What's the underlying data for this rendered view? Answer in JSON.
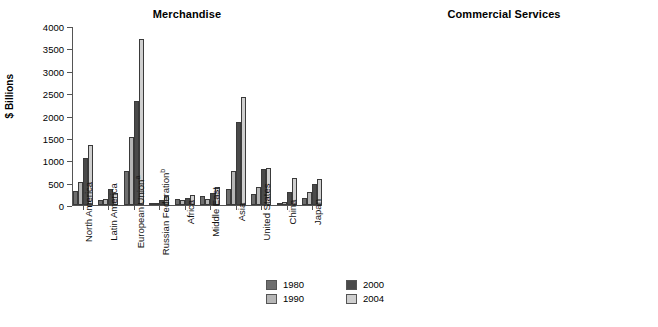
{
  "figure": {
    "legend": {
      "entries": [
        {
          "label": "1980",
          "color": "#6e6e6e",
          "key": "s1980"
        },
        {
          "label": "1990",
          "color": "#b6b6b6",
          "key": "s1990"
        },
        {
          "label": "2000",
          "color": "#4a4a4a",
          "key": "s2000"
        },
        {
          "label": "2004",
          "color": "#cfcfcf",
          "key": "s2004"
        }
      ]
    }
  },
  "chart_data": [
    {
      "type": "bar",
      "title": "Merchandise",
      "xlabel": "",
      "ylabel": "$ Billions",
      "ylim": [
        0,
        4000
      ],
      "yticks": [
        0,
        500,
        1000,
        1500,
        2000,
        2500,
        3000,
        3500,
        4000
      ],
      "grid": false,
      "legend_position": "bottom-center",
      "categories": [
        "North America",
        "Latin America",
        "European Union",
        "Russian Federation",
        "Africa",
        "Middle East",
        "Asia",
        "United States",
        "China",
        "Japan"
      ],
      "category_footnotes": [
        "",
        "",
        "a",
        "b",
        "",
        "",
        "",
        "",
        "",
        ""
      ],
      "series": [
        {
          "name": "1980",
          "values": [
            309,
            107,
            767,
            0,
            125,
            211,
            350,
            246,
            52,
            158
          ]
        },
        {
          "name": "1990",
          "values": [
            521,
            134,
            1524,
            0,
            105,
            138,
            751,
            410,
            75,
            280
          ]
        },
        {
          "name": "2000",
          "values": [
            1059,
            360,
            2334,
            105,
            148,
            268,
            1855,
            802,
            280,
            479
          ]
        },
        {
          "name": "2004",
          "values": [
            1330,
            276,
            3714,
            198,
            232,
            398,
            2410,
            824,
            612,
            581
          ]
        }
      ]
    },
    {
      "type": "bar",
      "title": "Commercial Services",
      "xlabel": "",
      "ylabel": "$ Billions",
      "ylim": [
        0,
        1200
      ],
      "yticks": [
        0,
        200,
        400,
        600,
        800,
        1000,
        1200
      ],
      "grid": false,
      "legend_position": "bottom-center",
      "categories": [
        "North America",
        "Latin America",
        "European Union",
        "Russian Federation",
        "Africa",
        "Middle East",
        "Asia",
        "United States",
        "China",
        "Japan"
      ],
      "category_footnotes": [
        "",
        "",
        "a",
        "b",
        "",
        "",
        "",
        "",
        "c",
        ""
      ],
      "series": [
        {
          "name": "1980",
          "values": [
            49,
            17,
            193,
            0,
            12,
            13,
            51,
            41,
            3,
            68
          ]
        },
        {
          "name": "1990",
          "values": [
            152,
            28,
            371,
            0,
            14,
            16,
            135,
            136,
            11,
            23
          ]
        },
        {
          "name": "2000",
          "values": [
            318,
            58,
            608,
            11,
            28,
            21,
            308,
            281,
            36,
            98
          ]
        },
        {
          "name": "2004",
          "values": [
            380,
            57,
            1129,
            31,
            43,
            36,
            453,
            320,
            62,
            50
          ]
        }
      ]
    }
  ]
}
